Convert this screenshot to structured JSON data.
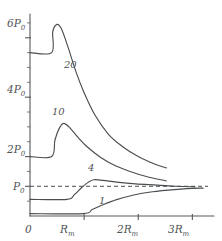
{
  "chart_data": {
    "type": "line",
    "title": "",
    "xlabel": "",
    "ylabel": "",
    "grid": false,
    "legend_position": "inline-curve-labels",
    "xlim": [
      0,
      3.4
    ],
    "ylim": [
      0,
      6.8
    ],
    "x_tick_labels": [
      "0",
      "R",
      "2R",
      "3R"
    ],
    "x_tick_subscripts": [
      "",
      "m",
      "m",
      "m"
    ],
    "x_tick_values": [
      0,
      1,
      2,
      3
    ],
    "y_tick_labels": [
      "P",
      "2P",
      "4P",
      "6P"
    ],
    "y_tick_subscripts": [
      "0",
      "0",
      "0",
      "0"
    ],
    "y_tick_values": [
      1,
      2,
      4,
      6
    ],
    "y_minor_tick_values": [
      0.5,
      1.5,
      2.5,
      3,
      3.5,
      4.5,
      5,
      5.5,
      6.5
    ],
    "asymptote": {
      "label": "P",
      "sublabel": "0",
      "value": 1,
      "style": "dashed"
    },
    "series": [
      {
        "name": "20",
        "label": "20",
        "plateau_value": 5.5,
        "jump_x": 0.42,
        "peak_x": 0.52,
        "peak_value": 6.45,
        "end_x": 2.52,
        "end_value": 1.62,
        "x": [
          0.0,
          0.4,
          0.42,
          0.5,
          0.58,
          0.7,
          0.85,
          1.0,
          1.2,
          1.45,
          1.7,
          2.0,
          2.3,
          2.52
        ],
        "y": [
          5.5,
          5.5,
          6.2,
          6.45,
          6.3,
          5.7,
          4.85,
          4.15,
          3.4,
          2.75,
          2.35,
          2.0,
          1.75,
          1.62
        ]
      },
      {
        "name": "10",
        "label": "10",
        "plateau_value": 2.0,
        "jump_x": 0.42,
        "peak_x": 0.62,
        "peak_value": 3.12,
        "end_x": 2.52,
        "end_value": 1.18,
        "x": [
          0.0,
          0.4,
          0.46,
          0.54,
          0.62,
          0.72,
          0.88,
          1.05,
          1.3,
          1.55,
          1.85,
          2.15,
          2.52
        ],
        "y": [
          2.0,
          2.0,
          2.55,
          2.95,
          3.12,
          3.0,
          2.66,
          2.34,
          1.98,
          1.72,
          1.5,
          1.33,
          1.18
        ]
      },
      {
        "name": "4",
        "label": "4",
        "plateau_value": 0.56,
        "jump_x": 0.7,
        "peak_x": 1.18,
        "peak_value": 1.22,
        "end_x": 3.05,
        "end_value": 0.98,
        "x": [
          0.0,
          0.68,
          0.82,
          0.95,
          1.08,
          1.18,
          1.35,
          1.6,
          1.95,
          2.35,
          2.7,
          3.05
        ],
        "y": [
          0.56,
          0.56,
          0.72,
          0.95,
          1.14,
          1.22,
          1.2,
          1.14,
          1.08,
          1.04,
          1.0,
          0.98
        ]
      },
      {
        "name": "1",
        "label": "1",
        "plateau_value": 0.08,
        "jump_x": 1.0,
        "end_x": 3.2,
        "end_value": 0.94,
        "x": [
          0.0,
          0.98,
          1.15,
          1.35,
          1.6,
          1.9,
          2.2,
          2.55,
          2.9,
          3.2
        ],
        "y": [
          0.08,
          0.08,
          0.22,
          0.38,
          0.55,
          0.7,
          0.8,
          0.87,
          0.92,
          0.94
        ]
      }
    ]
  }
}
